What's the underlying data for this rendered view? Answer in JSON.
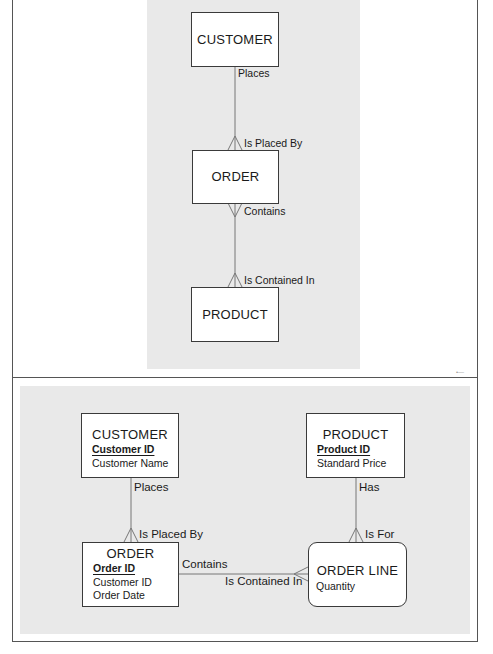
{
  "top_diagram": {
    "entities": [
      {
        "id": "customer",
        "label": "CUSTOMER"
      },
      {
        "id": "order",
        "label": "ORDER"
      },
      {
        "id": "product",
        "label": "PRODUCT"
      }
    ],
    "relationships": [
      {
        "from": "customer",
        "to": "order",
        "from_label": "Places",
        "to_label": "Is Placed By"
      },
      {
        "from": "order",
        "to": "product",
        "from_label": "Contains",
        "to_label": "Is Contained In"
      }
    ]
  },
  "bottom_diagram": {
    "entities": [
      {
        "id": "customer",
        "label": "CUSTOMER",
        "key": "Customer ID",
        "attributes": [
          "Customer Name"
        ]
      },
      {
        "id": "product",
        "label": "PRODUCT",
        "key": "Product ID",
        "attributes": [
          "Standard Price"
        ]
      },
      {
        "id": "order",
        "label": "ORDER",
        "key": "Order ID",
        "attributes": [
          "Customer ID",
          "Order Date"
        ]
      },
      {
        "id": "order_line",
        "label": "ORDER LINE",
        "key": "",
        "attributes": [
          "Quantity"
        ]
      }
    ],
    "relationships": [
      {
        "from": "customer",
        "to": "order",
        "from_label": "Places",
        "to_label": "Is Placed By"
      },
      {
        "from": "product",
        "to": "order_line",
        "from_label": "Has",
        "to_label": "Is For"
      },
      {
        "from": "order",
        "to": "order_line",
        "from_label": "Contains",
        "to_label": "Is Contained In"
      }
    ]
  },
  "colors": {
    "panel_background": "#e9e9e9",
    "entity_fill": "#ffffff",
    "line": "#777777"
  }
}
